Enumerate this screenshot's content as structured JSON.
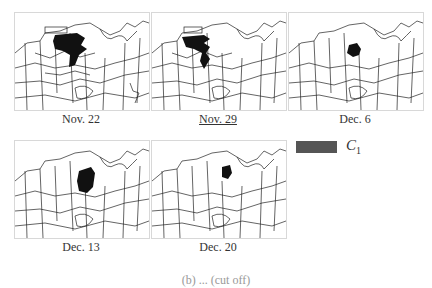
{
  "figure": {
    "panels": [
      {
        "id": "nov22",
        "label": "Nov. 22",
        "underlined": false,
        "highlight": "large-northwest-cluster"
      },
      {
        "id": "nov29",
        "label": "Nov. 29",
        "underlined": true,
        "highlight": "large-northwest-cluster"
      },
      {
        "id": "dec6",
        "label": "Dec. 6",
        "underlined": false,
        "highlight": "small-central-cluster"
      },
      {
        "id": "dec13",
        "label": "Dec. 13",
        "underlined": false,
        "highlight": "central-cluster"
      },
      {
        "id": "dec20",
        "label": "Dec. 20",
        "underlined": false,
        "highlight": "small-northcentral-cluster"
      }
    ],
    "legend": {
      "swatch_color": "#555555",
      "label_main": "C",
      "label_sub": "1"
    },
    "caption": "(b) ... (cut off)"
  },
  "colors": {
    "region_fill": "#111111",
    "boundary": "#222222",
    "background": "#ffffff"
  }
}
